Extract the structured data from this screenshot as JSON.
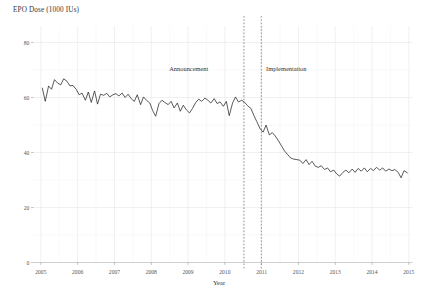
{
  "chart_data": {
    "type": "line",
    "title": "",
    "ylabel": "EPO Dose (1000 IUs)",
    "xlabel": "Year",
    "ylim": [
      0,
      86
    ],
    "xlim": [
      2004.8,
      2015.1
    ],
    "yticks": [
      0,
      20,
      40,
      60,
      80
    ],
    "ytick_labels": [
      "0",
      "20",
      "40",
      "60",
      "80"
    ],
    "xticks": [
      2005,
      2006,
      2007,
      2008,
      2009,
      2010,
      2011,
      2012,
      2013,
      2014,
      2015
    ],
    "xtick_labels": [
      "2005",
      "2006",
      "2007",
      "2008",
      "2009",
      "2010",
      "2011",
      "2012",
      "2013",
      "2014",
      "2015"
    ],
    "grid": true,
    "legend": "none",
    "line_color": "#2b2b2b",
    "annotations": [
      {
        "label": "Announcement",
        "x": 2010.52,
        "text_x": 2009.55,
        "text_y": 69.5
      },
      {
        "label": "Implementation",
        "x": 2010.99,
        "text_x": 2011.12,
        "text_y": 69.5
      }
    ],
    "vlines": [
      2010.52,
      2010.99
    ],
    "series": [
      {
        "name": "EPO Dose",
        "x": [
          2005.04,
          2005.12,
          2005.21,
          2005.29,
          2005.37,
          2005.46,
          2005.54,
          2005.62,
          2005.71,
          2005.79,
          2005.87,
          2005.96,
          2006.04,
          2006.12,
          2006.21,
          2006.29,
          2006.37,
          2006.46,
          2006.54,
          2006.62,
          2006.71,
          2006.79,
          2006.87,
          2006.96,
          2007.04,
          2007.12,
          2007.21,
          2007.29,
          2007.37,
          2007.46,
          2007.54,
          2007.62,
          2007.71,
          2007.79,
          2007.87,
          2007.96,
          2008.04,
          2008.12,
          2008.21,
          2008.29,
          2008.37,
          2008.46,
          2008.54,
          2008.62,
          2008.71,
          2008.79,
          2008.87,
          2008.96,
          2009.04,
          2009.12,
          2009.21,
          2009.29,
          2009.37,
          2009.46,
          2009.54,
          2009.62,
          2009.71,
          2009.79,
          2009.87,
          2009.96,
          2010.04,
          2010.12,
          2010.21,
          2010.29,
          2010.37,
          2010.46,
          2010.54,
          2010.62,
          2010.71,
          2010.79,
          2010.87,
          2010.96,
          2011.04,
          2011.12,
          2011.21,
          2011.29,
          2011.37,
          2011.46,
          2011.54,
          2011.62,
          2011.71,
          2011.79,
          2011.87,
          2011.96,
          2012.04,
          2012.12,
          2012.21,
          2012.29,
          2012.37,
          2012.46,
          2012.54,
          2012.62,
          2012.71,
          2012.79,
          2012.87,
          2012.96,
          2013.04,
          2013.12,
          2013.21,
          2013.29,
          2013.37,
          2013.46,
          2013.54,
          2013.62,
          2013.71,
          2013.79,
          2013.87,
          2013.96,
          2014.04,
          2014.12,
          2014.21,
          2014.29,
          2014.37,
          2014.46,
          2014.54,
          2014.62,
          2014.71,
          2014.79,
          2014.87,
          2014.96
        ],
        "y": [
          63.4,
          58.6,
          64.2,
          63.0,
          66.5,
          65.2,
          64.6,
          66.8,
          65.9,
          64.2,
          64.4,
          63.0,
          61.0,
          61.6,
          59.0,
          62.0,
          58.2,
          62.4,
          57.6,
          61.2,
          60.8,
          61.5,
          60.2,
          61.0,
          61.4,
          60.6,
          61.6,
          60.0,
          61.2,
          59.5,
          58.6,
          61.0,
          57.4,
          60.2,
          59.0,
          58.0,
          55.2,
          53.2,
          57.8,
          59.0,
          58.2,
          57.4,
          58.6,
          56.2,
          58.0,
          55.0,
          57.2,
          55.4,
          54.4,
          56.0,
          58.2,
          59.4,
          58.6,
          59.8,
          59.0,
          58.0,
          59.6,
          57.8,
          58.4,
          56.8,
          58.6,
          53.4,
          58.0,
          60.2,
          58.4,
          59.0,
          58.2,
          57.0,
          56.0,
          53.4,
          51.2,
          48.6,
          47.4,
          50.0,
          46.4,
          47.2,
          46.0,
          44.2,
          42.4,
          40.6,
          39.2,
          38.0,
          37.6,
          37.4,
          37.2,
          36.0,
          37.4,
          35.6,
          36.8,
          35.0,
          34.6,
          35.2,
          33.8,
          34.4,
          33.0,
          33.6,
          32.2,
          31.4,
          32.8,
          33.6,
          32.6,
          34.0,
          32.8,
          34.2,
          33.2,
          34.4,
          33.0,
          34.2,
          33.4,
          34.6,
          33.6,
          34.4,
          33.2,
          34.0,
          33.4,
          33.8,
          32.8,
          30.8,
          33.4,
          32.6
        ]
      }
    ]
  }
}
